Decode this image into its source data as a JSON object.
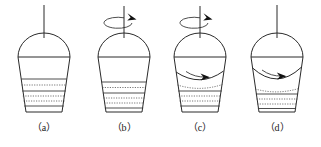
{
  "figure": {
    "stroke_color": "#2a2a2a",
    "sediment_color": "#4a4a4a",
    "arrow_color": "#111111",
    "background": "#ffffff",
    "panel_count": 4,
    "panels": [
      {
        "id": "a",
        "caption": "（a）",
        "shaft": {
          "visible": true,
          "rotation_indicator": false
        },
        "spin_arrow": {
          "visible": false,
          "direction": ""
        },
        "surface": {
          "type": "flat",
          "label": "flat-liquid-surface"
        },
        "internal_flow_arrow": {
          "visible": false,
          "direction": ""
        },
        "sediment": {
          "visible": true,
          "layer_count": 4,
          "top_level": 0.52,
          "shape": "flat-horizontal"
        },
        "description": "Vessel at rest: flat liquid surface, settled flat sediment bed"
      },
      {
        "id": "b",
        "caption": "（b）",
        "shaft": {
          "visible": true,
          "rotation_indicator": true
        },
        "spin_arrow": {
          "visible": true,
          "direction": "clockwise-viewed-from-above"
        },
        "surface": {
          "type": "flat",
          "label": "flat-liquid-surface"
        },
        "internal_flow_arrow": {
          "visible": false,
          "direction": ""
        },
        "sediment": {
          "visible": true,
          "layer_count": 4,
          "top_level": 0.56,
          "shape": "flat-horizontal"
        },
        "description": "Rotation started: surface still flat, sediment bed still flat"
      },
      {
        "id": "c",
        "caption": "（c）",
        "shaft": {
          "visible": true,
          "rotation_indicator": true
        },
        "spin_arrow": {
          "visible": true,
          "direction": "clockwise-viewed-from-above"
        },
        "surface": {
          "type": "curved-vortex-shallow",
          "label": "curved-liquid-surface"
        },
        "internal_flow_arrow": {
          "visible": true,
          "direction": "rightward-curved"
        },
        "sediment": {
          "visible": true,
          "layer_count": 4,
          "top_level": 0.58,
          "shape": "concave-curved"
        },
        "description": "Spinning fluid: shallow vortex dip, sediment surface curving"
      },
      {
        "id": "d",
        "caption": "（d）",
        "shaft": {
          "visible": true,
          "rotation_indicator": false
        },
        "spin_arrow": {
          "visible": false,
          "direction": ""
        },
        "surface": {
          "type": "curved-vortex-deep",
          "label": "curved-liquid-surface"
        },
        "internal_flow_arrow": {
          "visible": true,
          "direction": "rightward-curved"
        },
        "sediment": {
          "visible": true,
          "layer_count": 4,
          "top_level": 0.62,
          "shape": "concave-curved-deep"
        },
        "description": "Steady vortex: deeper curved surface, sediment concentrated lower"
      }
    ]
  }
}
